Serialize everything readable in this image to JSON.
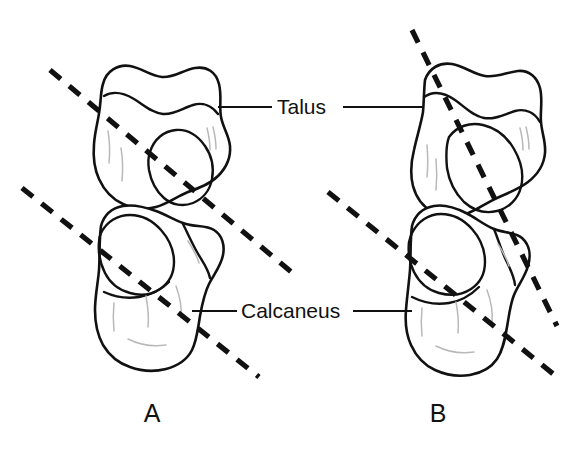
{
  "figure": {
    "type": "anatomical-line-drawing",
    "background_color": "#ffffff",
    "line_color": "#111111",
    "shade_color": "#b9b9b9",
    "width": 585,
    "height": 449
  },
  "labels": {
    "talus": "Talus",
    "calcaneus": "Calcaneus"
  },
  "panels": [
    {
      "letter": "A",
      "bones": [
        "Talus",
        "Calcaneus"
      ],
      "axis_lines": 2
    },
    {
      "letter": "B",
      "bones": [
        "Talus",
        "Calcaneus"
      ],
      "axis_lines": 2
    }
  ],
  "panel_letters": {
    "a": "A",
    "b": "B"
  }
}
